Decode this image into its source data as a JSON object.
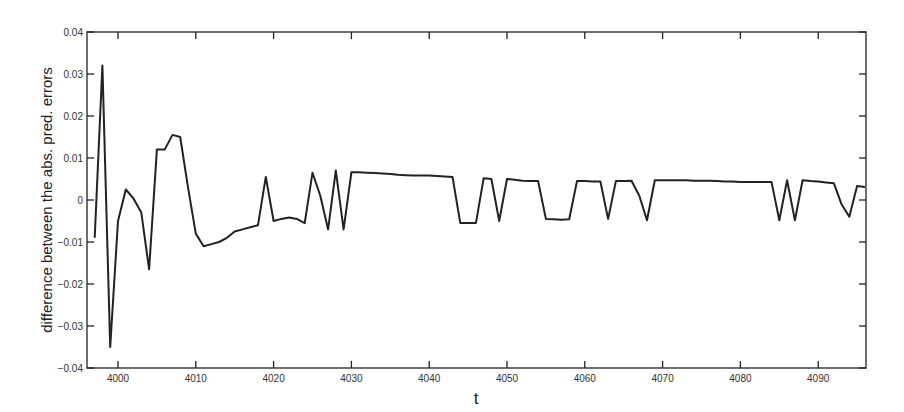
{
  "chart_data": {
    "type": "line",
    "title": "",
    "xlabel": "t",
    "ylabel": "difference between the abs. pred. errors",
    "xlim": [
      3996,
      4096
    ],
    "ylim": [
      -0.04,
      0.04
    ],
    "grid": false,
    "legend": null,
    "xticks": [
      4000,
      4010,
      4020,
      4030,
      4040,
      4050,
      4060,
      4070,
      4080,
      4090
    ],
    "xtick_labels": [
      "4000",
      "4010",
      "4020",
      "4030",
      "4040",
      "4050",
      "4060",
      "4070",
      "4080",
      "4090"
    ],
    "yticks": [
      -0.04,
      -0.03,
      -0.02,
      -0.01,
      0,
      0.01,
      0.02,
      0.03,
      0.04
    ],
    "ytick_labels": [
      "-0.04",
      "-0.03",
      "-0.02",
      "-0.01",
      "0",
      "0.01",
      "0.02",
      "0.03",
      "0.04"
    ],
    "series": [
      {
        "name": "difference",
        "color": "#222222",
        "x": [
          3997,
          3998,
          3999,
          4000,
          4001,
          4002,
          4003,
          4004,
          4005,
          4006,
          4007,
          4008,
          4009,
          4010,
          4011,
          4012,
          4013,
          4014,
          4015,
          4016,
          4017,
          4018,
          4019,
          4020,
          4021,
          4022,
          4023,
          4024,
          4025,
          4026,
          4027,
          4028,
          4029,
          4030,
          4031,
          4032,
          4033,
          4034,
          4035,
          4036,
          4037,
          4038,
          4039,
          4040,
          4041,
          4042,
          4043,
          4044,
          4045,
          4046,
          4047,
          4048,
          4049,
          4050,
          4051,
          4052,
          4053,
          4054,
          4055,
          4056,
          4057,
          4058,
          4059,
          4060,
          4061,
          4062,
          4063,
          4064,
          4065,
          4066,
          4067,
          4068,
          4069,
          4070,
          4071,
          4072,
          4073,
          4074,
          4075,
          4076,
          4077,
          4078,
          4079,
          4080,
          4081,
          4082,
          4083,
          4084,
          4085,
          4086,
          4087,
          4088,
          4089,
          4090,
          4091,
          4092,
          4093,
          4094,
          4095,
          4096
        ],
        "values": [
          -0.009,
          0.032,
          -0.035,
          -0.005,
          0.0025,
          0.0003,
          -0.003,
          -0.0165,
          0.012,
          0.012,
          0.0155,
          0.015,
          0.003,
          -0.008,
          -0.011,
          -0.0105,
          -0.01,
          -0.009,
          -0.0075,
          -0.007,
          -0.0065,
          -0.006,
          0.0055,
          -0.005,
          -0.0045,
          -0.0042,
          -0.0045,
          -0.0055,
          0.0065,
          0.001,
          -0.007,
          0.007,
          -0.007,
          0.0066,
          0.0066,
          0.0065,
          0.0064,
          0.0063,
          0.0062,
          0.006,
          0.0059,
          0.0058,
          0.0058,
          0.0058,
          0.0057,
          0.0056,
          0.0055,
          -0.0055,
          -0.0055,
          -0.0055,
          0.0052,
          0.005,
          -0.005,
          0.005,
          0.0048,
          0.0046,
          0.0045,
          0.0045,
          -0.0045,
          -0.0046,
          -0.0047,
          -0.0046,
          0.0045,
          0.0045,
          0.0044,
          0.0044,
          -0.0045,
          0.0045,
          0.0045,
          0.0046,
          0.001,
          -0.0048,
          0.0047,
          0.0047,
          0.0047,
          0.0047,
          0.0047,
          0.0046,
          0.0046,
          0.0046,
          0.0045,
          0.0044,
          0.0044,
          0.0043,
          0.0043,
          0.0043,
          0.0043,
          0.0043,
          -0.0048,
          0.0047,
          -0.0048,
          0.0047,
          0.0045,
          0.0044,
          0.0042,
          0.004,
          -0.001,
          -0.004,
          0.0033,
          0.0031
        ]
      }
    ]
  }
}
